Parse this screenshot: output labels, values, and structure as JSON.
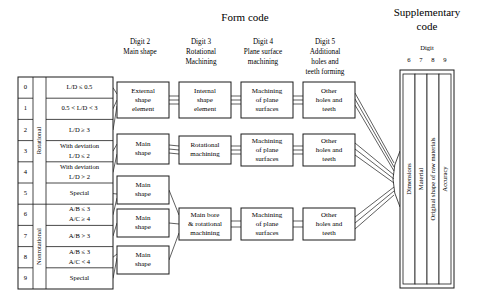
{
  "titles": {
    "form_code": "Form code",
    "supplementary_code_line1": "Supplementary",
    "supplementary_code_line2": "code",
    "digit_label": "Digit"
  },
  "column_headers": [
    {
      "name": "digit2",
      "line1": "Digit 2",
      "line2": "Main shape",
      "line3": "",
      "line4": ""
    },
    {
      "name": "digit3",
      "line1": "Digit 3",
      "line2": "Rotational",
      "line3": "Machining",
      "line4": ""
    },
    {
      "name": "digit4",
      "line1": "Digit 4",
      "line2": "Plane surface",
      "line3": "machining",
      "line4": ""
    },
    {
      "name": "digit5",
      "line1": "Digit 5",
      "line2": "Additional",
      "line3": "holes and",
      "line4": "teeth forming"
    }
  ],
  "digit1_table": {
    "group_labels": [
      {
        "name": "rotational",
        "text": "Rotational",
        "rows": [
          0,
          5
        ]
      },
      {
        "name": "nonrotational",
        "text": "Nonrotational",
        "rows": [
          6,
          9
        ]
      }
    ],
    "rows": [
      {
        "code": "0",
        "line1": "L/D ≤ 0.5",
        "line2": ""
      },
      {
        "code": "1",
        "line1": "0.5 < L/D < 3",
        "line2": ""
      },
      {
        "code": "2",
        "line1": "L/D ≥ 3",
        "line2": ""
      },
      {
        "code": "3",
        "line1": "With deviation",
        "line2": "L/D ≤ 2"
      },
      {
        "code": "4",
        "line1": "With deviation",
        "line2": "L/D > 2"
      },
      {
        "code": "5",
        "line1": "Special",
        "line2": ""
      },
      {
        "code": "6",
        "line1": "A/B ≤ 3",
        "line2": "A/C ≥ 4"
      },
      {
        "code": "7",
        "line1": "A/B > 3",
        "line2": ""
      },
      {
        "code": "8",
        "line1": "A/B ≤ 3",
        "line2": "A/C < 4"
      },
      {
        "code": "9",
        "line1": "Special",
        "line2": ""
      }
    ]
  },
  "digit2_boxes": [
    {
      "name": "external-shape-element",
      "lines": [
        "External",
        "shape",
        "element"
      ]
    },
    {
      "name": "main-shape-1",
      "lines": [
        "Main",
        "shape"
      ]
    },
    {
      "name": "main-shape-2",
      "lines": [
        "Main",
        "shape"
      ]
    },
    {
      "name": "main-shape-3",
      "lines": [
        "Main",
        "shape"
      ]
    },
    {
      "name": "main-shape-4",
      "lines": [
        "Main",
        "shape"
      ]
    }
  ],
  "digit3_boxes": [
    {
      "name": "internal-shape-element",
      "lines": [
        "Internal",
        "shape",
        "element"
      ]
    },
    {
      "name": "rotational-machining",
      "lines": [
        "Rotational",
        "machining"
      ]
    },
    {
      "name": "main-bore-rotational-machining",
      "lines": [
        "Main bore",
        "& rotational",
        "machining"
      ]
    }
  ],
  "digit4_boxes": [
    {
      "name": "machining-of-plane-surfaces-1",
      "lines": [
        "Machining",
        "of plane",
        "surfaces"
      ]
    },
    {
      "name": "machining-of-plane-surfaces-2",
      "lines": [
        "Machining",
        "of plane",
        "surfaces"
      ]
    },
    {
      "name": "machining-of-plane-surfaces-3",
      "lines": [
        "Machining",
        "of plane",
        "surfaces"
      ]
    }
  ],
  "digit5_boxes": [
    {
      "name": "other-holes-and-teeth-1",
      "lines": [
        "Other",
        "holes and",
        "teeth"
      ]
    },
    {
      "name": "other-holes-and-teeth-2",
      "lines": [
        "Other",
        "holes and",
        "teeth"
      ]
    },
    {
      "name": "other-holes-and-teeth-3",
      "lines": [
        "Other",
        "holes and",
        "teeth"
      ]
    }
  ],
  "supplementary": {
    "digits": [
      "6",
      "7",
      "8",
      "9"
    ],
    "columns": [
      {
        "name": "dimensions",
        "label": "Dimensions"
      },
      {
        "name": "material",
        "label": "Material"
      },
      {
        "name": "original-shape-of-raw-materials",
        "label": "Original shape of raw materials"
      },
      {
        "name": "accuracy",
        "label": "Accuracy"
      }
    ]
  },
  "colors": {
    "stroke": "#1a1a1a",
    "background": "#ffffff",
    "text": "#1a1a1a"
  }
}
